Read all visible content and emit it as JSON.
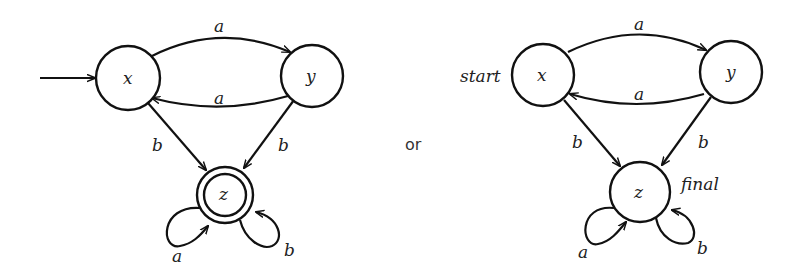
{
  "separator": "or",
  "diagrams": [
    {
      "name": "double-circle-notation",
      "states": [
        {
          "id": "x",
          "label": "x",
          "start": true,
          "final": false
        },
        {
          "id": "y",
          "label": "y",
          "start": false,
          "final": false
        },
        {
          "id": "z",
          "label": "z",
          "start": false,
          "final": true
        }
      ],
      "transitions": [
        {
          "from": "x",
          "to": "y",
          "label": "a"
        },
        {
          "from": "y",
          "to": "x",
          "label": "a"
        },
        {
          "from": "x",
          "to": "z",
          "label": "b"
        },
        {
          "from": "y",
          "to": "z",
          "label": "b"
        },
        {
          "from": "z",
          "to": "z",
          "label": "a"
        },
        {
          "from": "z",
          "to": "z",
          "label": "b"
        }
      ],
      "start_marker": "arrow",
      "final_marker": "double-circle"
    },
    {
      "name": "text-label-notation",
      "states": [
        {
          "id": "x",
          "label": "x",
          "start": true,
          "final": false
        },
        {
          "id": "y",
          "label": "y",
          "start": false,
          "final": false
        },
        {
          "id": "z",
          "label": "z",
          "start": false,
          "final": true
        }
      ],
      "transitions": [
        {
          "from": "x",
          "to": "y",
          "label": "a"
        },
        {
          "from": "y",
          "to": "x",
          "label": "a"
        },
        {
          "from": "x",
          "to": "z",
          "label": "b"
        },
        {
          "from": "y",
          "to": "z",
          "label": "b"
        },
        {
          "from": "z",
          "to": "z",
          "label": "a"
        },
        {
          "from": "z",
          "to": "z",
          "label": "b"
        }
      ],
      "start_label": "start",
      "final_label": "final"
    }
  ]
}
